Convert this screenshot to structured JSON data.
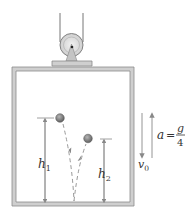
{
  "diagram": {
    "labels": {
      "h1": "h",
      "h1_sub": "1",
      "h2": "h",
      "h2_sub": "2",
      "v0": "v",
      "v0_sub": "0",
      "accel_lhs": "a",
      "accel_eq": "=",
      "accel_num": "g",
      "accel_den": "4"
    },
    "colors": {
      "wall": "#cfcfcf",
      "wall_edge": "#8a8a8a",
      "ball": "#7d7d7d",
      "line": "#777777",
      "text": "#333333"
    }
  }
}
